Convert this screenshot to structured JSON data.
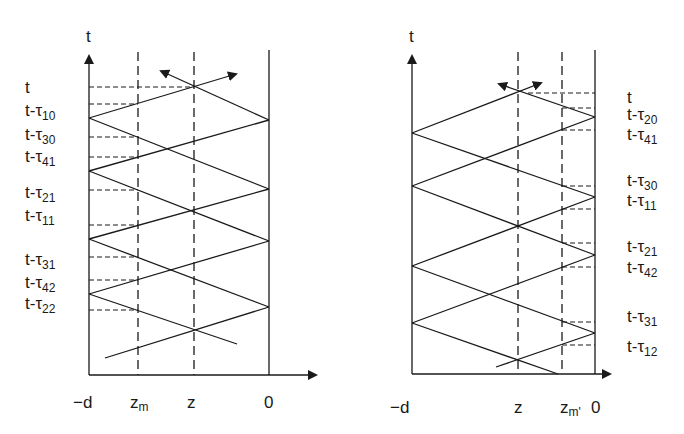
{
  "left_diagram": {
    "axis_label_t": "t",
    "x_labels": {
      "neg_d": "−d",
      "zm": "z",
      "zm_sub": "m",
      "z": "z",
      "zero": "0"
    },
    "time_labels": [
      {
        "base": "t",
        "sub": ""
      },
      {
        "base": "t-τ",
        "sub": "10"
      },
      {
        "base": "t-τ",
        "sub": "30"
      },
      {
        "base": "t-τ",
        "sub": "41"
      },
      {
        "base": "t-τ",
        "sub": "21"
      },
      {
        "base": "t-τ",
        "sub": "11"
      },
      {
        "base": "t-τ",
        "sub": "31"
      },
      {
        "base": "t-τ",
        "sub": "42"
      },
      {
        "base": "t-τ",
        "sub": "22"
      }
    ]
  },
  "right_diagram": {
    "axis_label_t": "t",
    "x_labels": {
      "neg_d": "−d",
      "z": "z",
      "zm": "z",
      "zm_sub": "m'",
      "zero": "0"
    },
    "time_labels": [
      {
        "base": "t",
        "sub": ""
      },
      {
        "base": "t-τ",
        "sub": "20"
      },
      {
        "base": "t-τ",
        "sub": "41"
      },
      {
        "base": "t-τ",
        "sub": "30"
      },
      {
        "base": "t-τ",
        "sub": "11"
      },
      {
        "base": "t-τ",
        "sub": "21"
      },
      {
        "base": "t-τ",
        "sub": "42"
      },
      {
        "base": "t-τ",
        "sub": "31"
      },
      {
        "base": "t-τ",
        "sub": "12"
      }
    ]
  },
  "colors": {
    "ink": "#1a1a1a",
    "background": "#ffffff"
  }
}
